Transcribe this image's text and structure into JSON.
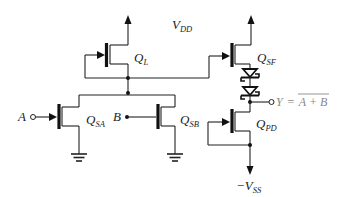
{
  "diagram": {
    "supplies": {
      "vdd": {
        "main": "V",
        "sub": "DD"
      },
      "vss": {
        "main": "−V",
        "sub": "SS"
      }
    },
    "transistors": [
      {
        "id": "QL",
        "main": "Q",
        "sub": "L",
        "role": "load"
      },
      {
        "id": "QSA",
        "main": "Q",
        "sub": "SA",
        "role": "switch A"
      },
      {
        "id": "QSB",
        "main": "Q",
        "sub": "SB",
        "role": "switch B"
      },
      {
        "id": "QSF",
        "main": "Q",
        "sub": "SF",
        "role": "source follower"
      },
      {
        "id": "QPD",
        "main": "Q",
        "sub": "PD",
        "role": "pull-down"
      }
    ],
    "inputs": [
      {
        "id": "A",
        "label": "A"
      },
      {
        "id": "B",
        "label": "B"
      }
    ],
    "output": {
      "label": "Y",
      "equals": "=",
      "expression": "A + B",
      "overline": true
    },
    "diodes": [
      {
        "id": "D1",
        "type": "schottky"
      },
      {
        "id": "D2",
        "type": "schottky"
      }
    ],
    "colors": {
      "wire": "#222222",
      "output_text": "#888888",
      "background": "#ffffff"
    }
  }
}
